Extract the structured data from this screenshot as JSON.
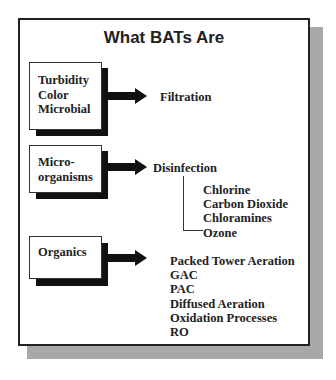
{
  "title": "What BATs Are",
  "rows": [
    {
      "contaminants": [
        "Turbidity",
        "Color",
        "Microbial"
      ],
      "treatment": "Filtration",
      "options": []
    },
    {
      "contaminants": [
        "Micro-",
        "organisms"
      ],
      "treatment": "Disinfection",
      "options": [
        "Chlorine",
        "Carbon Dioxide",
        "Chloramines",
        "Ozone"
      ]
    },
    {
      "contaminants": [
        "Organics"
      ],
      "treatment": "",
      "options": [
        "Packed Tower Aeration",
        "GAC",
        "PAC",
        "Diffused Aeration",
        "Oxidation Processes",
        "RO"
      ]
    }
  ],
  "colors": {
    "frame_border": "#222222",
    "frame_shadow": "#a8a8a8",
    "box_shadow": "#111111",
    "text": "#222222"
  }
}
